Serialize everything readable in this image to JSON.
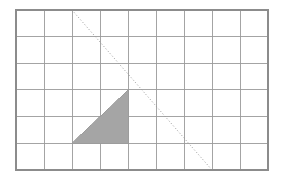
{
  "figure": {
    "canvas": {
      "width": 286,
      "height": 182,
      "background": "#ffffff"
    },
    "grid": {
      "name": "coordinate-grid",
      "columns": 9,
      "rows": 6,
      "origin_x": 16,
      "origin_y": 10,
      "cell_width": 28,
      "cell_height": 26.6,
      "width": 252,
      "height": 160,
      "line_color": "#9a9a9a",
      "line_width": 0.9,
      "border_color": "#8c8c8c",
      "border_width": 1.1,
      "fill": "#ffffff"
    },
    "triangle": {
      "name": "shaded-right-triangle",
      "fill_color": "#a5a5a5",
      "stroke_color": "#9a9a9a",
      "stroke_width": 0.8,
      "vertices_cells": [
        {
          "col": 4,
          "row": 3
        },
        {
          "col": 4,
          "row": 5
        },
        {
          "col": 2,
          "row": 5
        }
      ],
      "vertices_px": [
        {
          "x": 128,
          "y": 90
        },
        {
          "x": 128,
          "y": 143
        },
        {
          "x": 72,
          "y": 143
        }
      ],
      "base_cells": 2,
      "height_cells": 2
    },
    "diagonal": {
      "name": "dotted-diagonal-line",
      "start_px": {
        "x": 72,
        "y": 10
      },
      "end_px": {
        "x": 212,
        "y": 170
      },
      "start_cell": {
        "col": 2,
        "row": 0
      },
      "end_cell": {
        "col": 7,
        "row": 6
      },
      "color": "#9a9a9a",
      "width": 1,
      "dash": "1 2.2"
    }
  }
}
